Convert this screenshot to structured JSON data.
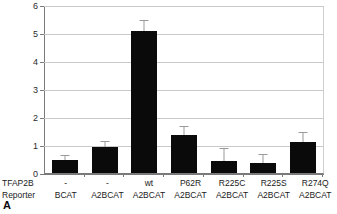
{
  "panel": {
    "letter": "A"
  },
  "chart_data": {
    "type": "bar",
    "title": "",
    "xlabel": "",
    "ylabel": "",
    "ylim": [
      0,
      6
    ],
    "yticks": [
      0,
      1,
      2,
      3,
      4,
      5,
      6
    ],
    "ytick_labels": [
      "0",
      "1",
      "2",
      "3",
      "4",
      "5",
      "6"
    ],
    "grid": true,
    "legend": "none",
    "row_headers": [
      "TFAP2B",
      "Reporter"
    ],
    "categories": [
      {
        "tfap2b": "-",
        "reporter": "BCAT"
      },
      {
        "tfap2b": "-",
        "reporter": "A2BCAT"
      },
      {
        "tfap2b": "wt",
        "reporter": "A2BCAT"
      },
      {
        "tfap2b": "P62R",
        "reporter": "A2BCAT"
      },
      {
        "tfap2b": "R225C",
        "reporter": "A2BCAT"
      },
      {
        "tfap2b": "R225S",
        "reporter": "A2BCAT"
      },
      {
        "tfap2b": "R274Q",
        "reporter": "A2BCAT"
      }
    ],
    "values": [
      0.48,
      0.92,
      5.12,
      1.38,
      0.42,
      0.35,
      1.13
    ],
    "errors": [
      0.12,
      0.21,
      0.35,
      0.28,
      0.43,
      0.29,
      0.32
    ],
    "bar_color": "#0a0a0a",
    "error_color": "#9a9a9a",
    "grid_color": "#c9c9c9",
    "axis_color": "#7a7a7a"
  }
}
